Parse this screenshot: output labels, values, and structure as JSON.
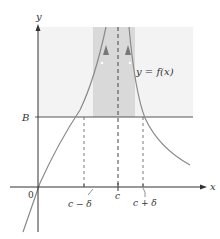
{
  "labels": {
    "y_axis": "y",
    "x_axis": "x",
    "b_level": "B",
    "origin": "0",
    "c": "c",
    "c_minus_delta": "c − δ",
    "c_plus_delta": "c + δ",
    "function": "y = f(x)"
  },
  "colors": {
    "axis": "#333333",
    "curve": "#8a8a8a",
    "light_region": "#f3f3f3",
    "dark_band": "#d9d9d9",
    "dashed": "#444444",
    "b_line": "#555555",
    "background": "#ffffff"
  },
  "geometry": {
    "x_axis_y": 187,
    "y_axis_x": 38,
    "b_y": 117,
    "c_x": 118,
    "c_minus_delta_x": 84,
    "c_plus_delta_x": 143,
    "band_left_x": 93,
    "band_right_x": 135
  }
}
